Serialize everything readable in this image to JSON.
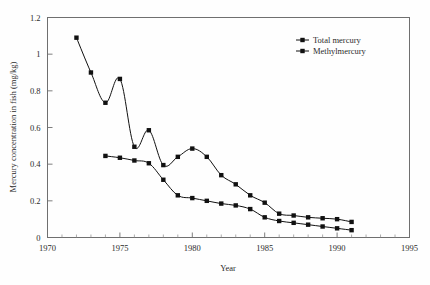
{
  "chart_data": {
    "type": "line",
    "title": "",
    "xlabel": "Year",
    "ylabel": "Mercury concentration in fish (mg/kg)",
    "xlim": [
      1970,
      1995
    ],
    "ylim": [
      0,
      1.2
    ],
    "xticks": [
      1970,
      1975,
      1980,
      1985,
      1990,
      1995
    ],
    "xtick_labels": [
      "1970",
      "1975",
      "1980",
      "1985",
      "1990",
      "1995"
    ],
    "yticks": [
      0,
      0.2,
      0.4,
      0.6,
      0.8,
      1,
      1.2
    ],
    "ytick_labels": [
      "0",
      "0.2",
      "0.4",
      "0.6",
      "0.8",
      "1",
      "1.2"
    ],
    "minor_xtick_interval": 1,
    "grid": false,
    "legend_position": "top-right",
    "marker": "filled-square",
    "line_color": "#111111",
    "series": [
      {
        "name": "Total mercury",
        "x": [
          1972,
          1973,
          1974,
          1975,
          1976,
          1977,
          1978,
          1979,
          1980,
          1981,
          1982,
          1983,
          1984,
          1985,
          1986,
          1987,
          1988,
          1989,
          1990,
          1991
        ],
        "values": [
          1.09,
          0.9,
          0.735,
          0.865,
          0.495,
          0.585,
          0.395,
          0.44,
          0.485,
          0.44,
          0.34,
          0.29,
          0.23,
          0.19,
          0.13,
          0.12,
          0.11,
          0.105,
          0.1,
          0.085
        ]
      },
      {
        "name": "Methylmercury",
        "x": [
          1974,
          1975,
          1976,
          1977,
          1978,
          1979,
          1980,
          1981,
          1982,
          1983,
          1984,
          1985,
          1986,
          1987,
          1988,
          1989,
          1990,
          1991
        ],
        "values": [
          0.445,
          0.435,
          0.42,
          0.405,
          0.315,
          0.23,
          0.215,
          0.2,
          0.185,
          0.175,
          0.155,
          0.11,
          0.09,
          0.08,
          0.07,
          0.06,
          0.05,
          0.04
        ]
      }
    ]
  },
  "legend": {
    "entries": [
      {
        "label": "Total mercury"
      },
      {
        "label": "Methylmercury"
      }
    ]
  },
  "axes": {
    "x_title": "Year",
    "y_title": "Mercury concentration in fish (mg/kg)"
  }
}
